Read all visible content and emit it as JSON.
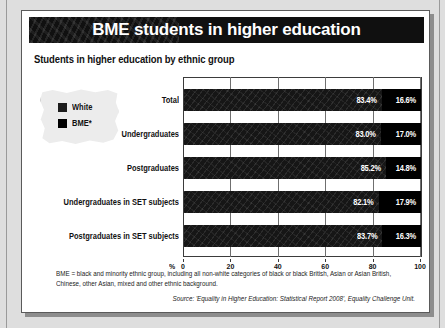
{
  "title": "BME students in higher education",
  "subtitle": "Students in higher education by ethnic group",
  "legend": {
    "white_label": "White",
    "bme_label": "BME*"
  },
  "axis": {
    "unit": "%",
    "ticks": [
      "0",
      "20",
      "40",
      "60",
      "80",
      "100"
    ]
  },
  "footnote": "BME = black and minority ethnic group, including all non-white categories of black or black British, Asian or Asian British, Chinese, other Asian, mixed and other ethnic background.",
  "source": "Source: 'Equality in Higher Education: Statistical Report 2008', Equality Challenge Unit.",
  "chart_data": {
    "type": "bar",
    "title": "Students in higher education by ethnic group",
    "xlabel": "%",
    "ylabel": "",
    "xlim": [
      0,
      100
    ],
    "grid": true,
    "legend_position": "left",
    "orientation": "horizontal",
    "stacked": true,
    "categories": [
      "Total",
      "Undergraduates",
      "Postgraduates",
      "Undergraduates in SET subjects",
      "Postgraduates in SET subjects"
    ],
    "series": [
      {
        "name": "White",
        "color": "#161616",
        "values": [
          83.4,
          83.0,
          85.2,
          82.1,
          83.7
        ]
      },
      {
        "name": "BME*",
        "color": "#000000",
        "values": [
          16.6,
          17.0,
          14.8,
          17.9,
          16.3
        ]
      }
    ],
    "data_labels": [
      {
        "category": "Total",
        "white": "83.4%",
        "bme": "16.6%"
      },
      {
        "category": "Undergraduates",
        "white": "83.0%",
        "bme": "17.0%"
      },
      {
        "category": "Postgraduates",
        "white": "85.2%",
        "bme": "14.8%"
      },
      {
        "category": "Undergraduates in SET subjects",
        "white": "82.1%",
        "bme": "17.9%"
      },
      {
        "category": "Postgraduates in SET subjects",
        "white": "83.7%",
        "bme": "16.3%"
      }
    ]
  }
}
